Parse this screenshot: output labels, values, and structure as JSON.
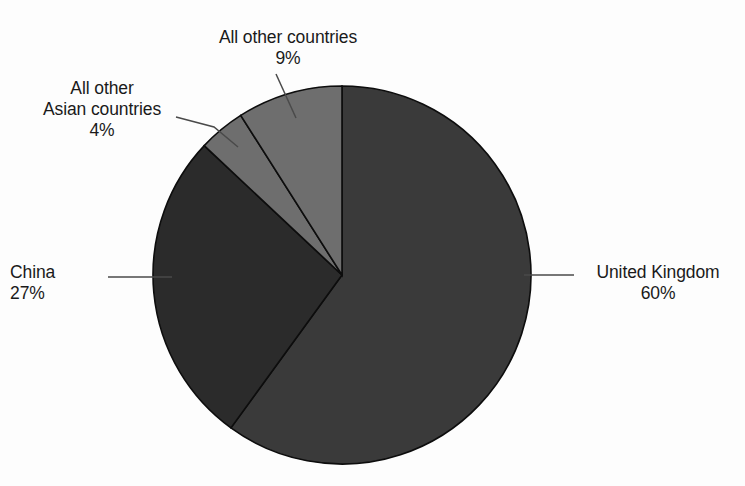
{
  "background_color": "#fdfdfd",
  "chart_data": {
    "type": "pie",
    "title": "",
    "subtitle": "",
    "xlabel": "",
    "ylabel": "",
    "legend_position": "none",
    "grid": false,
    "labels_outside": true,
    "total": 100,
    "units": "percent",
    "center": {
      "x": 342,
      "y": 275
    },
    "radius": 189,
    "start_angle_deg": 0,
    "direction": "clockwise",
    "categories": [
      "United Kingdom",
      "China",
      "All other Asian countries",
      "All other countries"
    ],
    "values": [
      60,
      27,
      4,
      9
    ],
    "value_labels": [
      "60%",
      "27%",
      "4%",
      "9%"
    ],
    "colors": [
      "#3a3a3a",
      "#2b2b2b",
      "#6e6e6e",
      "#6e6e6e"
    ],
    "slices": [
      {
        "name": "United Kingdom",
        "value": 60,
        "value_label": "60%",
        "color": "#3a3a3a",
        "start_deg": 0,
        "end_deg": 216
      },
      {
        "name": "China",
        "value": 27,
        "value_label": "27%",
        "color": "#2b2b2b",
        "start_deg": 216,
        "end_deg": 313.2
      },
      {
        "name": "All other Asian countries",
        "value": 4,
        "value_label": "4%",
        "color": "#6e6e6e",
        "start_deg": 313.2,
        "end_deg": 327.6
      },
      {
        "name": "All other countries",
        "value": 9,
        "value_label": "9%",
        "color": "#6e6e6e",
        "start_deg": 327.6,
        "end_deg": 360
      }
    ]
  },
  "labels": {
    "united_kingdom": {
      "name": "United Kingdom",
      "percent": "60%"
    },
    "china": {
      "name": "China",
      "percent": "27%"
    },
    "all_other_asian_countries": {
      "line1": "All other",
      "line2": "Asian countries",
      "percent": "4%"
    },
    "all_other_countries": {
      "name": "All other countries",
      "percent": "9%"
    }
  },
  "style": {
    "slice_outline_color": "#0d0d0d",
    "leader_line_color": "#4a4a4a",
    "text_color": "#1a1a1a"
  }
}
